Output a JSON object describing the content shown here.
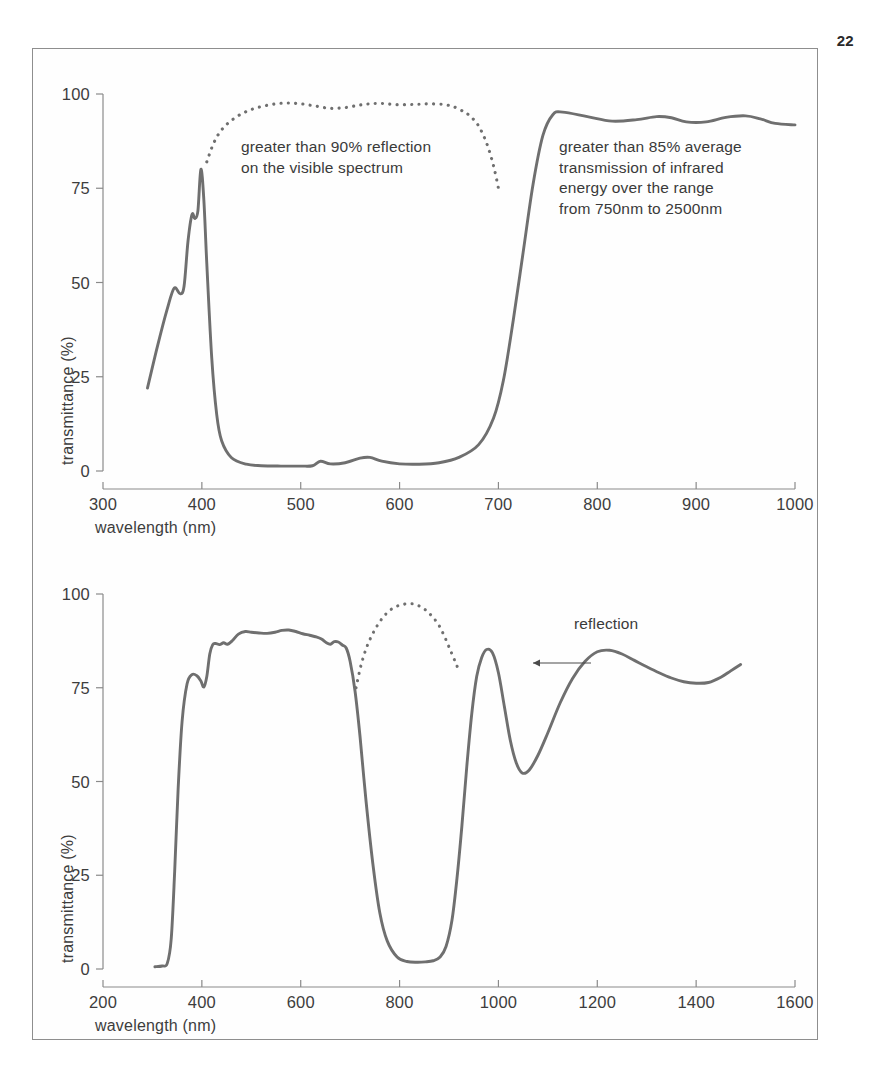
{
  "page": {
    "number": "22"
  },
  "figure": {
    "frame_color": "#8e8e8e",
    "curve_color": "#6f6f6f",
    "axis_color": "#8a8a8a",
    "text_color": "#3a3a3a"
  },
  "chart_data": [
    {
      "id": "top",
      "type": "line",
      "title": "",
      "xlabel": "wavelength (nm)",
      "ylabel": "transmittance (%)",
      "xlim": [
        300,
        1000
      ],
      "ylim": [
        0,
        100
      ],
      "xticks": [
        300,
        400,
        500,
        600,
        700,
        800,
        900,
        1000
      ],
      "yticks": [
        0,
        25,
        50,
        75,
        100
      ],
      "grid": false,
      "legend_position": "none",
      "series": [
        {
          "name": "transmittance",
          "style": "solid",
          "x": [
            345,
            355,
            365,
            372,
            378,
            382,
            386,
            390,
            393,
            396,
            399,
            402,
            405,
            410,
            415,
            420,
            430,
            445,
            460,
            480,
            500,
            512,
            520,
            530,
            545,
            560,
            570,
            582,
            600,
            620,
            640,
            660,
            680,
            695,
            705,
            715,
            725,
            735,
            745,
            755,
            765,
            790,
            815,
            840,
            860,
            875,
            890,
            910,
            930,
            950,
            965,
            980,
            1000
          ],
          "y": [
            22,
            33,
            43,
            48.5,
            47,
            49,
            61,
            68,
            67,
            69,
            80,
            72,
            55,
            30,
            15,
            8,
            3.5,
            1.8,
            1.4,
            1.3,
            1.3,
            1.4,
            2.6,
            1.9,
            2.2,
            3.4,
            3.6,
            2.6,
            1.9,
            1.8,
            2.2,
            3.6,
            7,
            14,
            24,
            40,
            58,
            76,
            89,
            94.5,
            95.2,
            94,
            92.8,
            93.2,
            94,
            93.7,
            92.6,
            92.6,
            93.8,
            94.2,
            93.4,
            92.2,
            91.8
          ]
        },
        {
          "name": "reflection",
          "style": "dotted",
          "x": [
            405,
            412,
            420,
            430,
            442,
            455,
            470,
            485,
            500,
            515,
            530,
            545,
            558,
            570,
            582,
            595,
            608,
            620,
            632,
            645,
            655,
            665,
            672,
            680,
            688,
            695,
            700
          ],
          "y": [
            82,
            87,
            90.5,
            93,
            95,
            96.3,
            97.2,
            97.6,
            97.4,
            96.8,
            96.2,
            96.4,
            97,
            97.4,
            97.5,
            97.2,
            97.2,
            97.3,
            97.4,
            97.2,
            96.6,
            95.3,
            94,
            91.5,
            87,
            81,
            75
          ]
        }
      ],
      "annotations": [
        {
          "id": "reflection-note",
          "text": "greater than 90% reflection\non the visible spectrum",
          "x_px": 240,
          "y_px": 136
        },
        {
          "id": "transmission-note",
          "text": "greater than 85% average\ntransmission of infrared\nenergy over the range\nfrom 750nm to 2500nm",
          "x_px": 558,
          "y_px": 136
        }
      ]
    },
    {
      "id": "bottom",
      "type": "line",
      "title": "",
      "xlabel": "wavelength (nm)",
      "ylabel": "transmittance (%)",
      "xlim": [
        200,
        1600
      ],
      "ylim": [
        0,
        100
      ],
      "xticks": [
        200,
        400,
        600,
        800,
        1000,
        1200,
        1400,
        1600
      ],
      "yticks": [
        0,
        25,
        50,
        75,
        100
      ],
      "grid": false,
      "legend_position": "none",
      "series": [
        {
          "name": "transmittance",
          "style": "solid",
          "x": [
            305,
            320,
            330,
            338,
            345,
            352,
            360,
            370,
            380,
            390,
            398,
            404,
            410,
            416,
            422,
            428,
            436,
            444,
            452,
            462,
            474,
            488,
            500,
            516,
            532,
            548,
            562,
            576,
            590,
            604,
            618,
            630,
            642,
            652,
            660,
            668,
            676,
            684,
            692,
            700,
            710,
            720,
            732,
            746,
            760,
            775,
            795,
            815,
            835,
            852,
            868,
            882,
            894,
            906,
            916,
            926,
            936,
            946,
            956,
            966,
            976,
            988,
            1000,
            1012,
            1024,
            1036,
            1048,
            1062,
            1080,
            1100,
            1125,
            1150,
            1175,
            1200,
            1225,
            1250,
            1275,
            1300,
            1325,
            1350,
            1375,
            1400,
            1425,
            1450,
            1470,
            1490
          ],
          "y": [
            0.6,
            0.8,
            1.5,
            8,
            26,
            48,
            66,
            76,
            78.5,
            78.2,
            76.8,
            75.2,
            78,
            84,
            86.5,
            86.8,
            86.5,
            87,
            86.6,
            87.6,
            89.3,
            90,
            89.8,
            89.6,
            89.5,
            89.8,
            90.3,
            90.4,
            90,
            89.4,
            89,
            88.6,
            88,
            87,
            86.6,
            87.3,
            87.2,
            86.4,
            85.6,
            82,
            74,
            62,
            45,
            28,
            15,
            7.5,
            3.2,
            2,
            1.8,
            1.9,
            2.2,
            3.2,
            6,
            13,
            24,
            38,
            54,
            68,
            78,
            83,
            85.2,
            84.3,
            79,
            70,
            61,
            55,
            52.3,
            53,
            57,
            63,
            71,
            77.5,
            82,
            84.6,
            85,
            84,
            82.3,
            80.6,
            79,
            77.6,
            76.6,
            76.2,
            76.4,
            77.8,
            79.5,
            81.2
          ]
        },
        {
          "name": "reflection",
          "style": "dotted",
          "x": [
            712,
            722,
            734,
            748,
            762,
            778,
            794,
            810,
            826,
            840,
            854,
            866,
            878,
            888,
            898,
            906,
            914,
            920
          ],
          "y": [
            75,
            81,
            86,
            90,
            93,
            95.4,
            96.7,
            97.3,
            97.4,
            96.8,
            95.6,
            94,
            92,
            89.5,
            86.5,
            84,
            81.5,
            79.5
          ]
        }
      ],
      "annotations": [
        {
          "id": "reflection-callout",
          "text": "reflection",
          "x_px": 573,
          "y_px": 614
        }
      ]
    }
  ]
}
